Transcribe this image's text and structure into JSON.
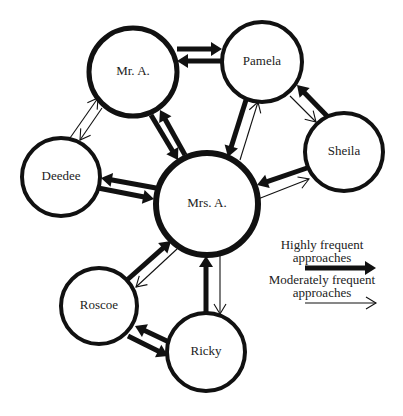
{
  "diagram": {
    "background": "#ffffff",
    "stroke_color": "#111111",
    "nodes": [
      {
        "id": "mr_a",
        "label": "Mr. A.",
        "cx": 133,
        "cy": 72,
        "r": 44,
        "stroke_width": 5
      },
      {
        "id": "pamela",
        "label": "Pamela",
        "cx": 262,
        "cy": 62,
        "r": 40,
        "stroke_width": 4
      },
      {
        "id": "sheila",
        "label": "Sheila",
        "cx": 344,
        "cy": 152,
        "r": 39,
        "stroke_width": 4
      },
      {
        "id": "deedee",
        "label": "Deedee",
        "cx": 61,
        "cy": 177,
        "r": 39,
        "stroke_width": 4
      },
      {
        "id": "mrs_a",
        "label": "Mrs. A.",
        "cx": 207,
        "cy": 204,
        "r": 51,
        "stroke_width": 6
      },
      {
        "id": "roscoe",
        "label": "Roscoe",
        "cx": 99,
        "cy": 306,
        "r": 38,
        "stroke_width": 4
      },
      {
        "id": "ricky",
        "label": "Ricky",
        "cx": 206,
        "cy": 352,
        "r": 39,
        "stroke_width": 4
      }
    ],
    "edges": [
      {
        "from": "Mr. A.",
        "to": "Pamela",
        "type": "high",
        "x1": 177,
        "y1": 49,
        "x2": 222,
        "y2": 49
      },
      {
        "from": "Pamela",
        "to": "Mr. A.",
        "type": "high",
        "x1": 222,
        "y1": 61,
        "x2": 177,
        "y2": 61
      },
      {
        "from": "Mr. A.",
        "to": "Mrs. A.",
        "type": "high",
        "x1": 151,
        "y1": 115,
        "x2": 178,
        "y2": 160
      },
      {
        "from": "Mrs. A.",
        "to": "Mr. A.",
        "type": "high",
        "x1": 185,
        "y1": 155,
        "x2": 160,
        "y2": 110
      },
      {
        "from": "Pamela",
        "to": "Mrs. A.",
        "type": "high",
        "x1": 246,
        "y1": 100,
        "x2": 228,
        "y2": 157
      },
      {
        "from": "Mrs. A.",
        "to": "Pamela",
        "type": "moderate",
        "x1": 240,
        "y1": 160,
        "x2": 258,
        "y2": 102
      },
      {
        "from": "Sheila",
        "to": "Pamela",
        "type": "high",
        "x1": 327,
        "y1": 116,
        "x2": 297,
        "y2": 85
      },
      {
        "from": "Pamela",
        "to": "Sheila",
        "type": "moderate",
        "x1": 290,
        "y1": 96,
        "x2": 316,
        "y2": 122
      },
      {
        "from": "Sheila",
        "to": "Mrs. A.",
        "type": "high",
        "x1": 307,
        "y1": 168,
        "x2": 257,
        "y2": 185
      },
      {
        "from": "Mrs. A.",
        "to": "Sheila",
        "type": "moderate",
        "x1": 258,
        "y1": 199,
        "x2": 309,
        "y2": 179
      },
      {
        "from": "Deedee",
        "to": "Mr. A.",
        "type": "moderate",
        "x1": 70,
        "y1": 138,
        "x2": 98,
        "y2": 98
      },
      {
        "from": "Mr. A.",
        "to": "Deedee",
        "type": "moderate",
        "x1": 102,
        "y1": 108,
        "x2": 80,
        "y2": 140
      },
      {
        "from": "Mrs. A.",
        "to": "Deedee",
        "type": "high",
        "x1": 156,
        "y1": 188,
        "x2": 101,
        "y2": 178
      },
      {
        "from": "Deedee",
        "to": "Mrs. A.",
        "type": "high",
        "x1": 98,
        "y1": 188,
        "x2": 154,
        "y2": 199
      },
      {
        "from": "Roscoe",
        "to": "Mrs. A.",
        "type": "high",
        "x1": 127,
        "y1": 280,
        "x2": 171,
        "y2": 241
      },
      {
        "from": "Mrs. A.",
        "to": "Roscoe",
        "type": "moderate",
        "x1": 177,
        "y1": 249,
        "x2": 136,
        "y2": 287
      },
      {
        "from": "Ricky",
        "to": "Mrs. A.",
        "type": "high",
        "x1": 206,
        "y1": 313,
        "x2": 206,
        "y2": 256
      },
      {
        "from": "Mrs. A.",
        "to": "Ricky",
        "type": "moderate",
        "x1": 220,
        "y1": 255,
        "x2": 220,
        "y2": 314
      },
      {
        "from": "Ricky",
        "to": "Roscoe",
        "type": "high",
        "x1": 169,
        "y1": 342,
        "x2": 135,
        "y2": 326
      },
      {
        "from": "Roscoe",
        "to": "Ricky",
        "type": "high",
        "x1": 128,
        "y1": 336,
        "x2": 168,
        "y2": 356
      }
    ]
  },
  "legend": {
    "high_label_line1": "Highly frequent",
    "high_label_line2": "approaches",
    "moderate_label_line1": "Moderately frequent",
    "moderate_label_line2": "approaches",
    "high_arrow": {
      "x1": 305,
      "y1": 268,
      "x2": 376,
      "y2": 268
    },
    "moderate_arrow": {
      "x1": 305,
      "y1": 303,
      "x2": 376,
      "y2": 303
    }
  }
}
